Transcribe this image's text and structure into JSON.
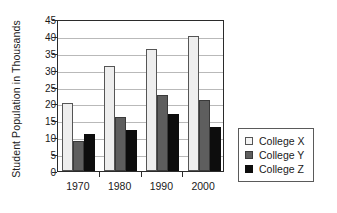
{
  "chart_data": {
    "type": "bar",
    "title": "",
    "xlabel": "",
    "ylabel": "Student Population in Thousands",
    "categories": [
      "1970",
      "1980",
      "1990",
      "2000"
    ],
    "series": [
      {
        "name": "College X",
        "color": "#eeeeee",
        "values": [
          20,
          31,
          36,
          40
        ]
      },
      {
        "name": "College Y",
        "color": "#5e5e5e",
        "values": [
          9,
          16,
          22.5,
          21
        ]
      },
      {
        "name": "College Z",
        "color": "#0d0d0d",
        "values": [
          11,
          12,
          17,
          13
        ]
      }
    ],
    "ylim": [
      0,
      45
    ],
    "yticks": [
      0,
      5,
      10,
      15,
      20,
      25,
      30,
      35,
      40,
      45
    ],
    "grid": true,
    "legend_position": "right"
  },
  "legend": {
    "items": [
      {
        "label": "College X",
        "swatch": "swatch-white"
      },
      {
        "label": "College Y",
        "swatch": "swatch-gray"
      },
      {
        "label": "College Z",
        "swatch": "swatch-black"
      }
    ]
  }
}
